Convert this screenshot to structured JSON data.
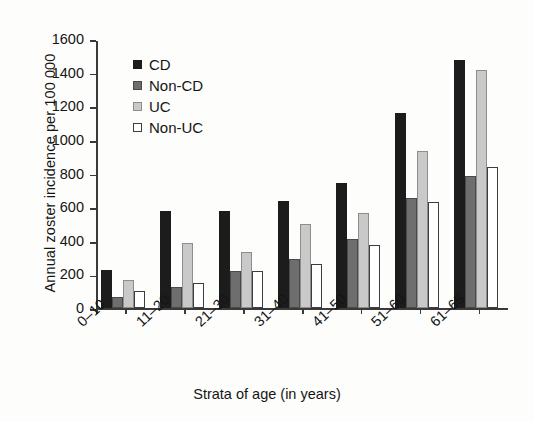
{
  "chart_data": {
    "type": "bar",
    "title": "",
    "subtitle": "",
    "xlabel": "Strata of age (in years)",
    "ylabel": "Annual zoster incidence per 100 000",
    "categories": [
      "0–10",
      "11–20",
      "21–30",
      "31–40",
      "41–50",
      "51–60",
      "61–65"
    ],
    "series": [
      {
        "name": "CD",
        "color": "#1c1c1c",
        "values": [
          230,
          580,
          580,
          640,
          745,
          1165,
          1480
        ]
      },
      {
        "name": "Non-CD",
        "color": "#6e6e6e",
        "values": [
          65,
          125,
          220,
          295,
          415,
          655,
          785
        ]
      },
      {
        "name": "UC",
        "color": "#c9c9c9",
        "values": [
          170,
          390,
          335,
          505,
          565,
          935,
          1420
        ]
      },
      {
        "name": "Non-UC",
        "color": "#ffffff",
        "values": [
          105,
          150,
          220,
          265,
          380,
          635,
          840
        ]
      }
    ],
    "ylim": [
      0,
      1600
    ],
    "yticks": [
      0,
      200,
      400,
      600,
      800,
      1000,
      1200,
      1400,
      1600
    ],
    "ytick_labels": [
      "0",
      "200",
      "400",
      "600",
      "800",
      "1000",
      "1200",
      "1400",
      "1600"
    ],
    "grid": false,
    "legend_position": "upper-left-inside",
    "legend_entries": [
      "CD",
      "Non-CD",
      "UC",
      "Non-UC"
    ]
  }
}
